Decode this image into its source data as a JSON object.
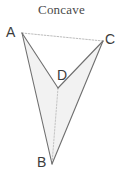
{
  "figure": {
    "title": "Concave",
    "background_color": "#ffffff",
    "width": 123,
    "height": 183,
    "shape_type": "concave quadrilateral (dart)",
    "fill_color": "#f2f2f2",
    "solid_edge_color": "#6b6b6b",
    "dotted_edge_color": "#b9b9b9",
    "label_color": "#3c3c3c",
    "title_color": "#4a4a4a"
  },
  "vertices": [
    {
      "name": "A",
      "label": "A",
      "x": 22,
      "y": 33,
      "label_x": 6,
      "label_y": 25
    },
    {
      "name": "C",
      "label": "C",
      "x": 103,
      "y": 41,
      "label_x": 105,
      "label_y": 32
    },
    {
      "name": "D",
      "label": "D",
      "x": 58,
      "y": 88,
      "label_x": 57,
      "label_y": 68
    },
    {
      "name": "B",
      "label": "B",
      "x": 52,
      "y": 164,
      "label_x": 37,
      "label_y": 155
    }
  ],
  "edges": [
    {
      "name": "edge-AD",
      "from": "A",
      "to": "D",
      "style": "solid"
    },
    {
      "name": "edge-DC",
      "from": "D",
      "to": "C",
      "style": "solid"
    },
    {
      "name": "edge-AB",
      "from": "A",
      "to": "B",
      "style": "solid"
    },
    {
      "name": "edge-BC",
      "from": "B",
      "to": "C",
      "style": "solid"
    },
    {
      "name": "edge-AC",
      "from": "A",
      "to": "C",
      "style": "dotted"
    },
    {
      "name": "edge-DB",
      "from": "D",
      "to": "B",
      "style": "dotted"
    }
  ],
  "chart_data": {
    "type": "diagram",
    "title": "Concave",
    "points": {
      "A": [
        22,
        33
      ],
      "C": [
        103,
        41
      ],
      "D": [
        58,
        88
      ],
      "B": [
        52,
        164
      ]
    },
    "polygon_outline": [
      "A",
      "D",
      "C",
      "B"
    ],
    "solid_segments": [
      [
        "A",
        "D"
      ],
      [
        "D",
        "C"
      ],
      [
        "A",
        "B"
      ],
      [
        "B",
        "C"
      ]
    ],
    "dotted_segments": [
      [
        "A",
        "C"
      ],
      [
        "D",
        "B"
      ]
    ]
  }
}
